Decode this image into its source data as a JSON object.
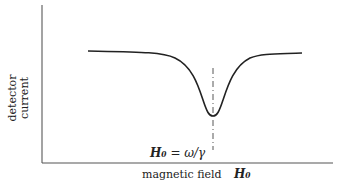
{
  "diagram": {
    "y_axis_label_line1": "detector",
    "y_axis_label_line2": "current",
    "x_axis_label": "magnetic field",
    "x_axis_symbol": "H₀",
    "resonance_left": "H₀",
    "resonance_eq": " = ",
    "resonance_right": "ω/γ",
    "curve": "absorption dip centered at resonance",
    "colors": {
      "curve": "#222222",
      "axes": "#555555"
    }
  }
}
